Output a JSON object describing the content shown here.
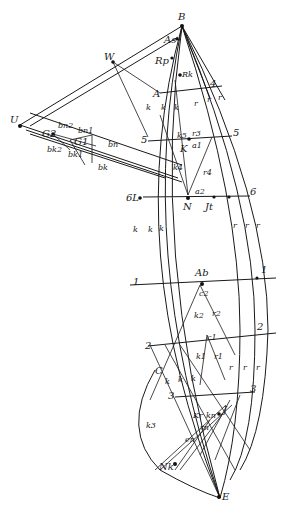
{
  "diagram": {
    "type": "geometric-construction",
    "background": "#ffffff",
    "ink": "#1a1a1a",
    "points": {
      "B": "B",
      "As": "As",
      "Rp": "Rp",
      "Rk": "Rk",
      "W": "W",
      "U": "U",
      "A": "A",
      "K": "K",
      "N": "N",
      "L": "6L",
      "Jt": "Jt",
      "Ab": "Ab",
      "C": "C",
      "J": "J",
      "Nk": "Nk",
      "E": "E",
      "G2": "G2",
      "G1": "G1"
    },
    "numbers": {
      "n4l": "4",
      "n4r": "4",
      "n5l": "5",
      "n5r": "5",
      "n6r": "6",
      "n1l": "1",
      "n1r": "1",
      "n2l": "2",
      "n2r": "2",
      "n3l": "3",
      "n3r": "3"
    },
    "line_labels": {
      "k": "k",
      "r": "r",
      "k2": "k2",
      "k3": "k3",
      "k4": "k4",
      "k1": "k1",
      "k5": "k5",
      "r1": "r1",
      "r2": "r2",
      "r3": "r3",
      "r4": "r4",
      "a1": "a1",
      "a2": "a2",
      "c1": "c1",
      "c2": "c2",
      "bn": "bn",
      "bn1": "bn1",
      "bn2": "bn2",
      "bk": "bk",
      "bk1": "bk1",
      "bk2": "bk2",
      "Kr": "Kr",
      "kn": "kn",
      "rn": "rn",
      "en": "en"
    }
  }
}
